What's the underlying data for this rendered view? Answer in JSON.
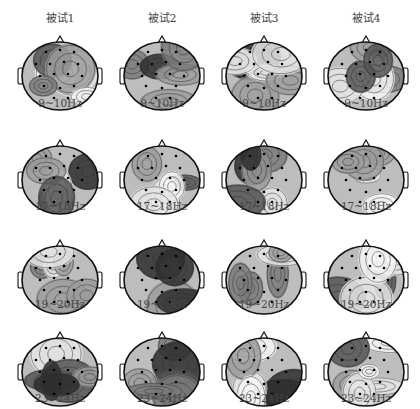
{
  "figure": {
    "columns": [
      {
        "label": "被试1"
      },
      {
        "label": "被试2"
      },
      {
        "label": "被试3"
      },
      {
        "label": "被试4"
      }
    ],
    "rows": [
      {
        "band": "9~10Hz"
      },
      {
        "band": "17~18Hz"
      },
      {
        "band": "19~20Hz"
      },
      {
        "band": "23~24Hz"
      }
    ],
    "map_type": "EEG scalp topography (grayscale, contour lines, electrode dots)",
    "colors": {
      "high": "#f2f2f2",
      "mid": "#b8b8b8",
      "low": "#3a3a3a",
      "outline": "#111111"
    }
  }
}
